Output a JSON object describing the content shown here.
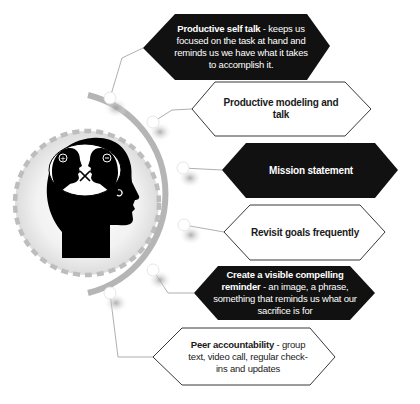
{
  "diagram": {
    "colors": {
      "dark_box": "#111111",
      "light_box_border": "#222222",
      "arc": "#b5b5b5",
      "dashed_circle": "#bdbdbd",
      "connector": "#9a9a9a",
      "head": "#000000"
    },
    "center_graphic": {
      "icon": "head-with-two-faces-icon"
    },
    "items": [
      {
        "style": "dark",
        "title": "Productive self talk",
        "separator": " - ",
        "description": "keeps us focused on the task at hand and reminds us we have what it takes to accomplish it."
      },
      {
        "style": "light",
        "title": "Productive modeling and talk",
        "separator": "",
        "description": ""
      },
      {
        "style": "dark",
        "title": "Mission statement",
        "separator": "",
        "description": ""
      },
      {
        "style": "light",
        "title": "Revisit goals frequently",
        "separator": "",
        "description": ""
      },
      {
        "style": "dark",
        "title": "Create a visible compelling reminder",
        "separator": " - ",
        "description": "an image, a phrase, something that reminds us what our sacrifice is for"
      },
      {
        "style": "light",
        "title": "Peer accountability",
        "separator": " - ",
        "description": "group text, video call, regular check-ins and updates"
      }
    ]
  }
}
